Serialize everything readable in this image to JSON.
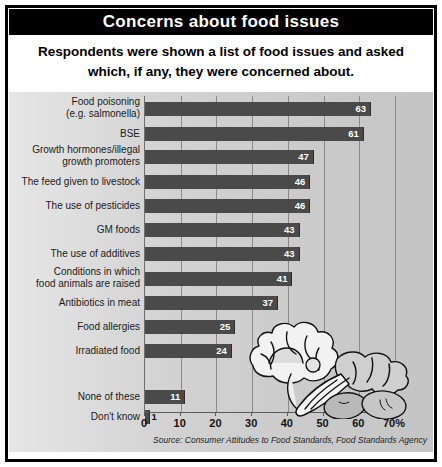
{
  "title": "Concerns about food issues",
  "subtitle_line1": "Respondents were shown a list of food issues and asked",
  "subtitle_line2": "which, if any, they were concerned about.",
  "source": "Source: Consumer Attitudes to Food Standards, Food Standards Agency",
  "colors": {
    "title_bar_bg": "#000000",
    "title_text": "#ffffff",
    "bar_fill": "#4a4a4a",
    "panel_bg": "#d2d2d2",
    "gridline": "#8a8a8a",
    "frame": "#000000"
  },
  "illustration": "vegetables-lettuce-celery-potatoes",
  "chart_data": {
    "type": "bar",
    "orientation": "horizontal",
    "title": "Concerns about food issues",
    "subtitle": "Respondents were shown a list of food issues and asked which, if any, they were concerned about.",
    "xlabel": "",
    "ylabel": "",
    "xlim": [
      0,
      70
    ],
    "xticks": [
      0,
      10,
      20,
      30,
      40,
      50,
      60,
      70
    ],
    "xtick_labels": [
      "0",
      "10",
      "20",
      "30",
      "40",
      "50",
      "60",
      "70%"
    ],
    "grid": true,
    "legend": "none",
    "source": "Source: Consumer Attitudes to Food Standards, Food Standards Agency",
    "categories": [
      "Food poisoning\n(e.g. salmonella)",
      "BSE",
      "Growth hormones/illegal\ngrowth promoters",
      "The feed given to livestock",
      "The use of pesticides",
      "GM foods",
      "The use of additives",
      "Conditions in which\nfood animals are raised",
      "Antibiotics in meat",
      "Food allergies",
      "Irradiated food",
      "None of these",
      "Don't know"
    ],
    "values": [
      63,
      61,
      47,
      46,
      46,
      43,
      43,
      41,
      37,
      25,
      24,
      11,
      1
    ]
  },
  "bars": [
    {
      "label_line1": "Food poisoning",
      "label_line2": "(e.g. salmonella)",
      "value": 63,
      "value_text": "63"
    },
    {
      "label_line1": "BSE",
      "label_line2": "",
      "value": 61,
      "value_text": "61"
    },
    {
      "label_line1": "Growth hormones/illegal",
      "label_line2": "growth promoters",
      "value": 47,
      "value_text": "47"
    },
    {
      "label_line1": "The feed given to livestock",
      "label_line2": "",
      "value": 46,
      "value_text": "46"
    },
    {
      "label_line1": "The use of pesticides",
      "label_line2": "",
      "value": 46,
      "value_text": "46"
    },
    {
      "label_line1": "GM foods",
      "label_line2": "",
      "value": 43,
      "value_text": "43"
    },
    {
      "label_line1": "The use of additives",
      "label_line2": "",
      "value": 43,
      "value_text": "43"
    },
    {
      "label_line1": "Conditions in which",
      "label_line2": "food animals are raised",
      "value": 41,
      "value_text": "41"
    },
    {
      "label_line1": "Antibiotics in meat",
      "label_line2": "",
      "value": 37,
      "value_text": "37"
    },
    {
      "label_line1": "Food allergies",
      "label_line2": "",
      "value": 25,
      "value_text": "25"
    },
    {
      "label_line1": "Irradiated food",
      "label_line2": "",
      "value": 24,
      "value_text": "24"
    },
    {
      "label_line1": "None of these",
      "label_line2": "",
      "value": 11,
      "value_text": "11"
    },
    {
      "label_line1": "Don't know",
      "label_line2": "",
      "value": 1,
      "value_text": "1"
    }
  ],
  "axis": {
    "ticks": [
      {
        "value": 0,
        "label": "0"
      },
      {
        "value": 10,
        "label": "10"
      },
      {
        "value": 20,
        "label": "20"
      },
      {
        "value": 30,
        "label": "30"
      },
      {
        "value": 40,
        "label": "40"
      },
      {
        "value": 50,
        "label": "50"
      },
      {
        "value": 60,
        "label": "60"
      },
      {
        "value": 70,
        "label": "70%"
      }
    ]
  }
}
